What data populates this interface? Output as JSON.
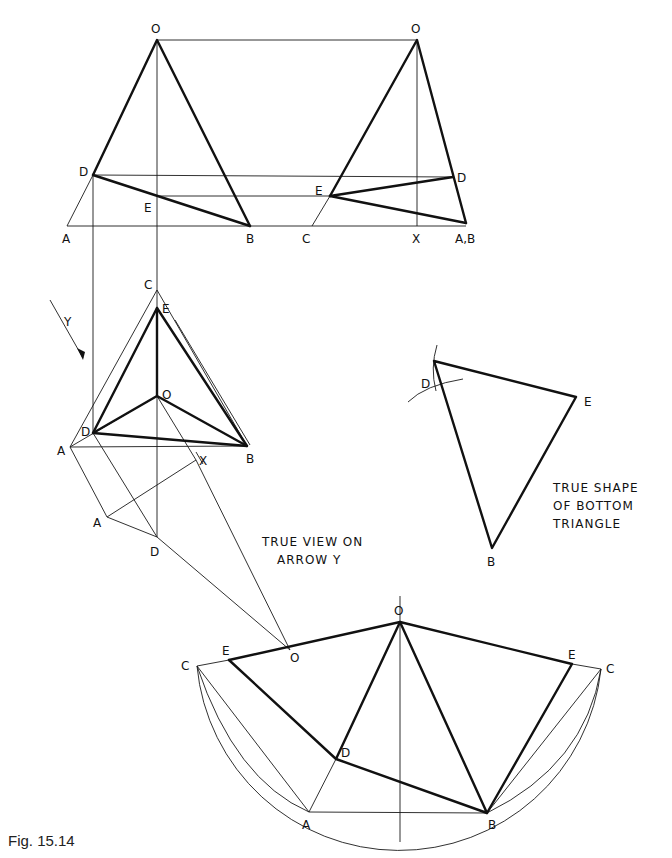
{
  "figure": {
    "caption": "Fig. 15.14"
  },
  "views": {
    "front_elevation": {
      "labels": {
        "O": "O",
        "D": "D",
        "E": "E",
        "A": "A",
        "B": "B"
      }
    },
    "end_elevation": {
      "labels": {
        "O": "O",
        "D": "D",
        "E": "E",
        "C": "C",
        "X": "X",
        "AB": "A,B"
      }
    },
    "plan": {
      "labels": {
        "C": "C",
        "E": "E",
        "O": "O",
        "D": "D",
        "A": "A",
        "B": "B",
        "X": "X",
        "Y": "Y",
        "A2": "A",
        "D2": "D",
        "O2": "O"
      }
    },
    "true_view": {
      "note_line1": "TRUE VIEW ON",
      "note_line2": "ARROW Y"
    },
    "true_shape": {
      "labels": {
        "D": "D",
        "E": "E",
        "B": "B"
      },
      "note_line1": "TRUE SHAPE",
      "note_line2": "OF BOTTOM",
      "note_line3": "TRIANGLE"
    },
    "development": {
      "labels": {
        "O": "O",
        "E_left": "E",
        "C_left": "C",
        "D": "D",
        "A": "A",
        "B": "B",
        "E_right": "E",
        "C_right": "C"
      }
    }
  },
  "colors": {
    "ink": "#111111",
    "paper": "#ffffff"
  }
}
